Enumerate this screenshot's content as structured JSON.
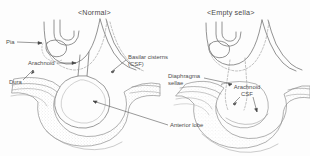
{
  "figure": {
    "caption_type": "anatomical-diagram",
    "panels": [
      {
        "id": "normal",
        "title": "<Normal>"
      },
      {
        "id": "empty_sella",
        "title": "<Empty sella>"
      }
    ],
    "labels": {
      "pia": "Pia",
      "arachnoid_left": "Arachnoid",
      "dura": "Dura",
      "basilar_cisterns": "Basilar cisterns (CSF)",
      "anterior_lobe": "Anterior lobe",
      "diaphragma_sellae": "Diaphragma sellae",
      "arachnoid_csf": "Arachnoid CSF"
    },
    "colors": {
      "background": "#fdfdfd",
      "stroke": "#6b6b6b",
      "light_stroke": "#9a9a9a",
      "text": "#4d4d4d",
      "stipple": "#b5b5b5"
    }
  }
}
